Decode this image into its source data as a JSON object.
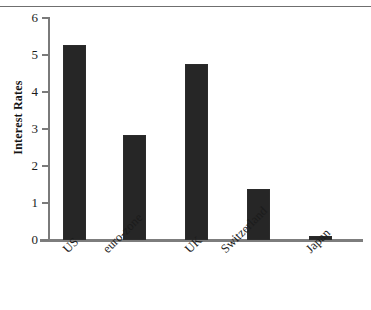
{
  "chart_data": {
    "type": "bar",
    "title": "",
    "xlabel": "",
    "ylabel": "Interest Rates",
    "categories": [
      "US",
      "euro-zone",
      "UK",
      "Switzerland",
      "Japan"
    ],
    "values": [
      5.27,
      2.85,
      4.75,
      1.39,
      0.1
    ],
    "ylim": [
      0,
      6
    ],
    "ytick_labels": [
      "6",
      "5",
      "4",
      "3",
      "2",
      "1",
      "0"
    ],
    "ytick_values": [
      6,
      5,
      4,
      3,
      2,
      1,
      0
    ],
    "grid": false,
    "legend": null,
    "bar_color": "#262626",
    "axis_color": "#7a7a7a",
    "background_color": "#ffffff"
  },
  "figure": {
    "y_axis_title": "Interest Rates",
    "top_rule_color": "#6f6f6f"
  }
}
